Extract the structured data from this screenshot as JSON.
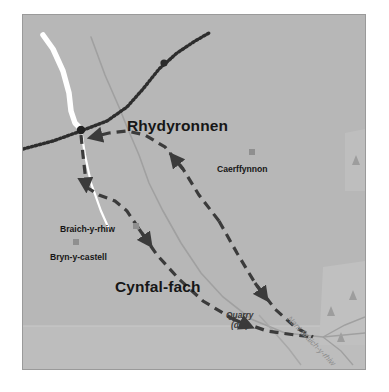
{
  "map": {
    "background_color": "#b7b7b7",
    "border_color": "#9a9a9a",
    "settlements": [
      {
        "name": "Rhydyronnen",
        "x": 104,
        "y": 103
      },
      {
        "name": "Cynfal-fach",
        "x": 92,
        "y": 264
      }
    ],
    "places": [
      {
        "name": "Caerffynnon",
        "x": 194,
        "y": 150,
        "marker_x": 226,
        "marker_y": 134
      },
      {
        "name": "Braich-y-rhiw",
        "x": 37,
        "y": 210,
        "marker_x": 110,
        "marker_y": 208
      },
      {
        "name": "Bryn-y-castell",
        "x": 27,
        "y": 238,
        "marker_x": 50,
        "marker_y": 224
      }
    ],
    "features": [
      {
        "name": "Quarry",
        "sub": "(dis)",
        "x": 203,
        "y": 296
      }
    ],
    "watercourses": [
      {
        "name": "Nant Braich-y-rhiw",
        "x": 268,
        "y": 300,
        "rotation": 46
      }
    ],
    "colors": {
      "road_main": "#ffffff",
      "road_minor": "#9e9e9e",
      "railway": "#2e2e2e",
      "route": "#3b3b3b",
      "water": "#a5a5a5",
      "woodland": "#c2c2c2",
      "marker": "#8f8f8f"
    },
    "legend_semantics": {
      "railway": "dotted-railway-line",
      "route": "dashed-walking-route-with-direction-arrows",
      "station_node": "railway-station-marker",
      "building": "building-marker-square",
      "tree": "conifer-woodland-symbol"
    }
  }
}
